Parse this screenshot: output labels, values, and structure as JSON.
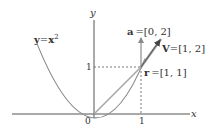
{
  "diagram": {
    "axes": {
      "x_label": "x",
      "y_label": "y",
      "origin_label": "0",
      "x_tick_label": "1",
      "y_tick_label": "1"
    },
    "curve": {
      "equation_lhs": "y",
      "equation_eq": "=",
      "equation_base": "x",
      "equation_exp": "2",
      "color": "#8a8a8a"
    },
    "point_r": {
      "name": "r",
      "value": "=[1, 1]"
    },
    "vector_a": {
      "name": "a",
      "value": "=[0, 2]",
      "color": "#8a8a8a"
    },
    "vector_v": {
      "name": "V",
      "value": "=[1, 2]",
      "color": "#8a8a8a"
    },
    "colors": {
      "axis": "#555555",
      "dashed": "#555555",
      "text": "#333333"
    }
  }
}
